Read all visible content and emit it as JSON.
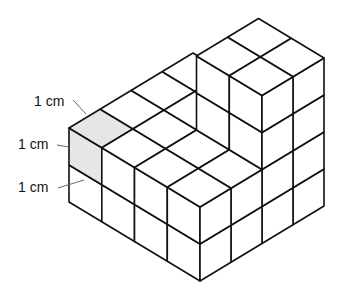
{
  "diagram": {
    "colors": {
      "face_fill": "#ffffff",
      "shaded_fill": "#e6e6e6",
      "edge": "#111111",
      "leader": "#555555",
      "text": "#111111"
    },
    "projection": {
      "origin": [
        69,
        202
      ],
      "u": [
        32.75,
        19.75
      ],
      "v": [
        31,
        -18.75
      ],
      "h": 37
    },
    "footprint": {
      "u_count": 4,
      "v_count": 4
    },
    "heights": [
      [
        2,
        2,
        2,
        2
      ],
      [
        2,
        2,
        2,
        2
      ],
      [
        2,
        2,
        4,
        4
      ],
      [
        2,
        2,
        4,
        4
      ]
    ],
    "shaded_cube": {
      "a": 0,
      "b": 0,
      "c": 1
    },
    "labels": [
      {
        "text": "1 cm",
        "x": 34,
        "y": 106,
        "leader": [
          73,
          100,
          86,
          114
        ]
      },
      {
        "text": "1 cm",
        "x": 18,
        "y": 149,
        "leader": [
          57,
          145,
          69,
          147
        ]
      },
      {
        "text": "1 cm",
        "x": 18,
        "y": 192,
        "leader": [
          58,
          188,
          84,
          180
        ]
      }
    ]
  }
}
